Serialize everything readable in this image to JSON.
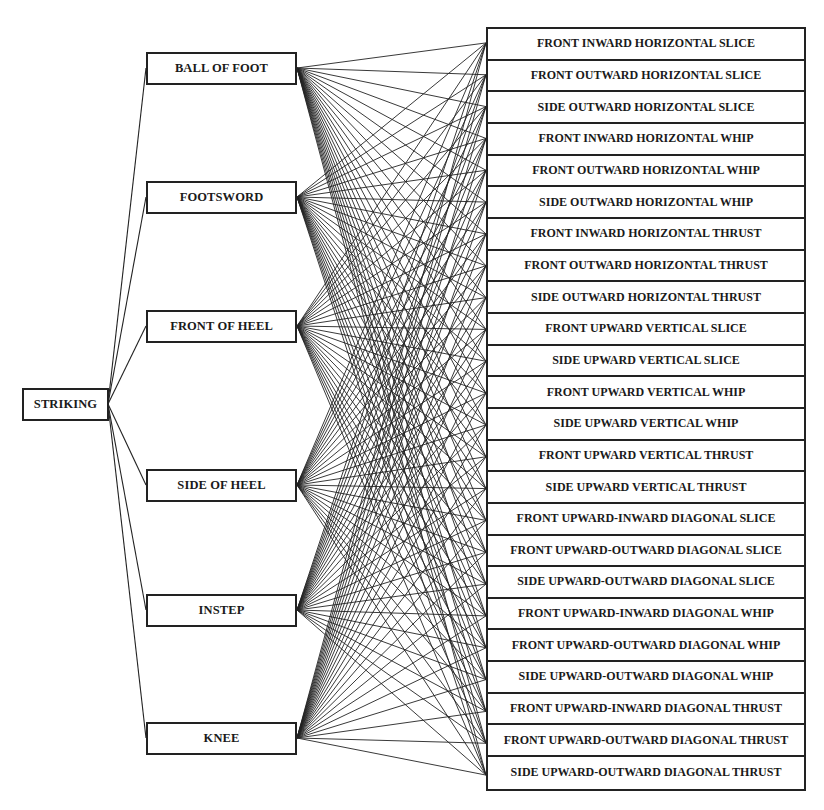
{
  "diagram": {
    "root": {
      "label": "STRIKING"
    },
    "body_parts": [
      {
        "label": "BALL OF FOOT",
        "top": 52
      },
      {
        "label": "FOOTSWORD",
        "top": 181
      },
      {
        "label": "FRONT OF HEEL",
        "top": 310
      },
      {
        "label": "SIDE OF HEEL",
        "top": 469
      },
      {
        "label": "INSTEP",
        "top": 594
      },
      {
        "label": "KNEE",
        "top": 722
      }
    ],
    "techniques": [
      "FRONT INWARD HORIZONTAL SLICE",
      "FRONT OUTWARD HORIZONTAL SLICE",
      "SIDE OUTWARD HORIZONTAL SLICE",
      "FRONT INWARD HORIZONTAL WHIP",
      "FRONT OUTWARD HORIZONTAL WHIP",
      "SIDE OUTWARD HORIZONTAL WHIP",
      "FRONT INWARD HORIZONTAL THRUST",
      "FRONT OUTWARD HORIZONTAL THRUST",
      "SIDE OUTWARD HORIZONTAL THRUST",
      "FRONT UPWARD VERTICAL SLICE",
      "SIDE UPWARD VERTICAL SLICE",
      "FRONT UPWARD VERTICAL WHIP",
      "SIDE UPWARD VERTICAL WHIP",
      "FRONT UPWARD VERTICAL THRUST",
      "SIDE UPWARD VERTICAL THRUST",
      "FRONT UPWARD-INWARD DIAGONAL SLICE",
      "FRONT UPWARD-OUTWARD DIAGONAL SLICE",
      "SIDE UPWARD-OUTWARD DIAGONAL SLICE",
      "FRONT UPWARD-INWARD DIAGONAL WHIP",
      "FRONT UPWARD-OUTWARD DIAGONAL WHIP",
      "SIDE UPWARD-OUTWARD DIAGONAL WHIP",
      "FRONT UPWARD-INWARD DIAGONAL THRUST",
      "FRONT UPWARD-OUTWARD DIAGONAL THRUST",
      "SIDE UPWARD-OUTWARD DIAGONAL THRUST"
    ],
    "connections": "every body part connects to every technique; root connects to every body part",
    "line_color": "#222222",
    "box_border_color": "#222222"
  }
}
